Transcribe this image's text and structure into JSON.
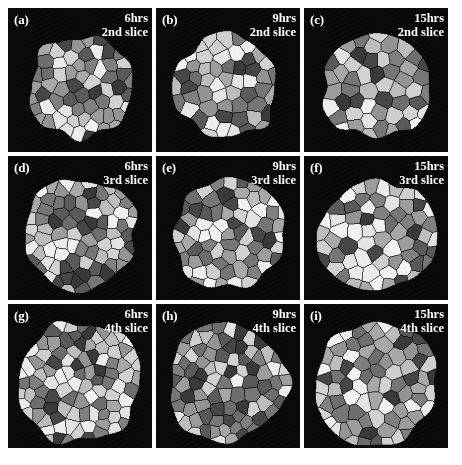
{
  "figure": {
    "background_color": "#ffffff",
    "panel_background_color": "#0a0a0a",
    "label_color": "#ffffff",
    "rows": 3,
    "columns": 3,
    "bottom_caption": ""
  },
  "panels": [
    {
      "letter": "(a)",
      "time": "6hrs",
      "slice": "2nd slice",
      "grain_count": 62,
      "mean_grain_px": 11.0,
      "cluster_radius_px": 52
    },
    {
      "letter": "(b)",
      "time": "9hrs",
      "slice": "2nd slice",
      "grain_count": 56,
      "mean_grain_px": 11.8,
      "cluster_radius_px": 52
    },
    {
      "letter": "(c)",
      "time": "15hrs",
      "slice": "2nd slice",
      "grain_count": 52,
      "mean_grain_px": 12.6,
      "cluster_radius_px": 53
    },
    {
      "letter": "(d)",
      "time": "6hrs",
      "slice": "3rd slice",
      "grain_count": 78,
      "mean_grain_px": 10.2,
      "cluster_radius_px": 57
    },
    {
      "letter": "(e)",
      "time": "9hrs",
      "slice": "3rd slice",
      "grain_count": 70,
      "mean_grain_px": 10.8,
      "cluster_radius_px": 56
    },
    {
      "letter": "(f)",
      "time": "15hrs",
      "slice": "3rd slice",
      "grain_count": 66,
      "mean_grain_px": 11.4,
      "cluster_radius_px": 57
    },
    {
      "letter": "(g)",
      "time": "6hrs",
      "slice": "4th slice",
      "grain_count": 95,
      "mean_grain_px": 9.6,
      "cluster_radius_px": 61
    },
    {
      "letter": "(h)",
      "time": "9hrs",
      "slice": "4th slice",
      "grain_count": 86,
      "mean_grain_px": 10.1,
      "cluster_radius_px": 60
    },
    {
      "letter": "(i)",
      "time": "15hrs",
      "slice": "4th slice",
      "grain_count": 80,
      "mean_grain_px": 10.6,
      "cluster_radius_px": 61
    }
  ],
  "grain_shades": [
    "#f2f2f2",
    "#e4e4e4",
    "#d2d2d2",
    "#bdbdbd",
    "#a8a8a8",
    "#949494",
    "#808080",
    "#6e6e6e",
    "#5a5a5a",
    "#474747",
    "#3a3a3a",
    "#cfcfcf",
    "#9d9d9d",
    "#767676",
    "#ededed"
  ]
}
